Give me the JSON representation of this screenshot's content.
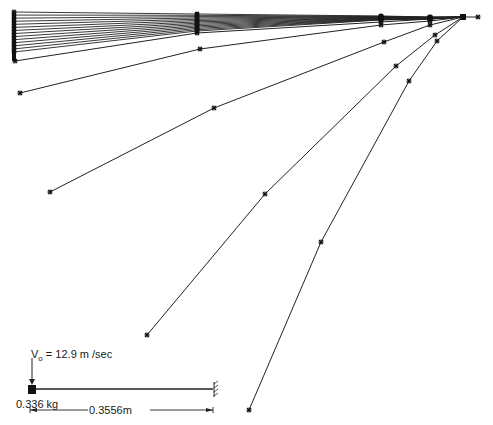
{
  "figure": {
    "root": {
      "x": 463,
      "y": 17
    },
    "root_extra_marker": {
      "x": 478,
      "y": 17
    },
    "line_color": "#222222",
    "marker_color": "#111111",
    "dense_profiles": {
      "count": 14,
      "tip_x": 14,
      "tip_y_start": 12,
      "tip_y_end": 52,
      "n1_x": 197,
      "n1_y_start": 14,
      "n1_y_end": 31,
      "n2_x": 381,
      "n2_y_start": 16,
      "n2_y_end": 20,
      "n3_x": 430,
      "n3_y_start": 17,
      "n3_y_end": 19
    },
    "profiles": [
      {
        "name": "profile-15",
        "points": [
          [
            15,
            61
          ],
          [
            197,
            33
          ],
          [
            381,
            22
          ],
          [
            430,
            19
          ],
          [
            463,
            17
          ]
        ]
      },
      {
        "name": "profile-16",
        "points": [
          [
            20,
            93
          ],
          [
            200,
            49
          ],
          [
            381,
            25
          ],
          [
            430,
            21
          ],
          [
            463,
            17
          ]
        ]
      },
      {
        "name": "profile-17",
        "points": [
          [
            50,
            192
          ],
          [
            214,
            108
          ],
          [
            384,
            42
          ],
          [
            430,
            25
          ],
          [
            463,
            17
          ]
        ]
      },
      {
        "name": "profile-18",
        "points": [
          [
            147,
            335
          ],
          [
            265,
            194
          ],
          [
            396,
            66
          ],
          [
            435,
            35
          ],
          [
            463,
            17
          ]
        ]
      },
      {
        "name": "profile-19",
        "points": [
          [
            249,
            410
          ],
          [
            321,
            242
          ],
          [
            409,
            81
          ],
          [
            437,
            41
          ],
          [
            463,
            17
          ]
        ]
      }
    ]
  },
  "inset": {
    "velocity_label_prefix": "V",
    "velocity_label_sub": "o",
    "velocity_label_value": "= 12.9 m /sec",
    "mass_label": "0.336 kg",
    "length_label": "0.3556m"
  }
}
